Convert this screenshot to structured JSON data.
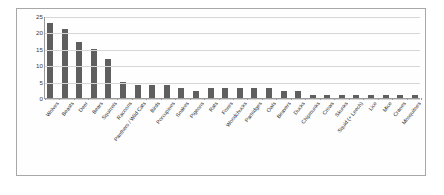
{
  "chart_data": {
    "type": "bar",
    "title": "",
    "subtitle": "",
    "xlabel": "",
    "ylabel": "",
    "ylim": [
      0,
      25
    ],
    "yticks": [
      0,
      5,
      10,
      15,
      20,
      25
    ],
    "grid": true,
    "legend": false,
    "bar_color": "#5f5f5f",
    "categories": [
      "Wolves",
      "Beasts",
      "Deer",
      "Bears",
      "Squirrels",
      "Racoons",
      "Panthers / Wild Cats",
      "Birds",
      "Porcupines",
      "Snakes",
      "Pigeons",
      "Rats",
      "Foxes",
      "Woodchucks",
      "Partridges",
      "Owls",
      "Beavers",
      "Ducks",
      "Chipmunks",
      "Crows",
      "Skunks",
      "Squid (+ Leech)",
      "Lice",
      "Mice",
      "Cranes",
      "Mosquitoes"
    ],
    "values": [
      23,
      21,
      17,
      15,
      12,
      5,
      4,
      4,
      4,
      3,
      2,
      3,
      3,
      3,
      3,
      3,
      2,
      2,
      1,
      1,
      1,
      1,
      1,
      1,
      1,
      1
    ]
  }
}
